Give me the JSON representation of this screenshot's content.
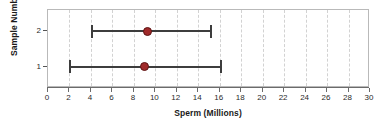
{
  "chart_data": {
    "type": "scatter",
    "title": "",
    "xlabel": "Sperm (Millions)",
    "ylabel": "Sample Number",
    "xlim": [
      0,
      30
    ],
    "xticks": [
      0,
      2,
      4,
      6,
      8,
      10,
      12,
      14,
      16,
      18,
      20,
      22,
      24,
      26,
      28,
      30
    ],
    "xtick_labels": [
      "0",
      "2",
      "4",
      "6",
      "8",
      "10",
      "12",
      "14",
      "16",
      "18",
      "20",
      "22",
      "24",
      "26",
      "28",
      "30"
    ],
    "ylim": [
      0.4,
      2.6
    ],
    "yticks": [
      1,
      2
    ],
    "ytick_labels": [
      "1",
      "2"
    ],
    "grid": "vertical-dashed",
    "legend": "none",
    "orientation": "horizontal",
    "marker_color": "#a02a2a",
    "marker_edge_color": "#5d1414",
    "errorbar_color": "#3d3d3d",
    "gridline_color": "#d2d2d2",
    "axis_color": "#6b6b6b",
    "frame_color": "#b9b9b9",
    "series": [
      {
        "name": "Sample 1",
        "y": 1,
        "ytick_label": "1",
        "value": 9.0,
        "lower": 2.0,
        "upper": 16.0
      },
      {
        "name": "Sample 2",
        "y": 2,
        "ytick_label": "2",
        "value": 9.3,
        "lower": 4.0,
        "upper": 15.1
      }
    ]
  }
}
